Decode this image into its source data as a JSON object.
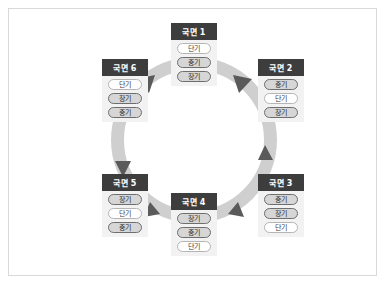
{
  "diagram": {
    "title": "",
    "ring": {
      "direction": "clockwise",
      "band_color": "#cfcfcf",
      "arrow_color": "#5a5a5a"
    },
    "colors": {
      "header_bg": "#3d3d3d",
      "header_text": "#ffffff",
      "panel_bg": "#f2f2f2",
      "pill_light_bg": "#ffffff",
      "pill_dark_bg": "#d6d6d6",
      "border": "#d9d9d9"
    },
    "panels": [
      {
        "id": "phase-1",
        "title": "국면 1",
        "items": [
          {
            "label": "단기",
            "style": "light"
          },
          {
            "label": "중기",
            "style": "dark"
          },
          {
            "label": "장기",
            "style": "dark"
          }
        ]
      },
      {
        "id": "phase-2",
        "title": "국면 2",
        "items": [
          {
            "label": "중기",
            "style": "dark"
          },
          {
            "label": "단기",
            "style": "light"
          },
          {
            "label": "장기",
            "style": "dark"
          }
        ]
      },
      {
        "id": "phase-3",
        "title": "국면 3",
        "items": [
          {
            "label": "중기",
            "style": "dark"
          },
          {
            "label": "장기",
            "style": "dark"
          },
          {
            "label": "단기",
            "style": "light"
          }
        ]
      },
      {
        "id": "phase-4",
        "title": "국면 4",
        "items": [
          {
            "label": "장기",
            "style": "dark"
          },
          {
            "label": "중기",
            "style": "dark"
          },
          {
            "label": "단기",
            "style": "light"
          }
        ]
      },
      {
        "id": "phase-5",
        "title": "국면 5",
        "items": [
          {
            "label": "장기",
            "style": "dark"
          },
          {
            "label": "단기",
            "style": "light"
          },
          {
            "label": "중기",
            "style": "dark"
          }
        ]
      },
      {
        "id": "phase-6",
        "title": "국면 6",
        "items": [
          {
            "label": "단기",
            "style": "light"
          },
          {
            "label": "장기",
            "style": "dark"
          },
          {
            "label": "중기",
            "style": "dark"
          }
        ]
      }
    ],
    "arrows": [
      {
        "name": "arrow-phase1-to-phase2",
        "from": "phase-1",
        "to": "phase-2"
      },
      {
        "name": "arrow-phase2-to-phase3",
        "from": "phase-2",
        "to": "phase-3"
      },
      {
        "name": "arrow-phase3-to-phase4",
        "from": "phase-3",
        "to": "phase-4"
      },
      {
        "name": "arrow-phase4-to-phase5",
        "from": "phase-4",
        "to": "phase-5"
      },
      {
        "name": "arrow-phase5-to-phase6",
        "from": "phase-5",
        "to": "phase-6"
      },
      {
        "name": "arrow-phase6-to-phase1",
        "from": "phase-6",
        "to": "phase-1"
      }
    ]
  }
}
